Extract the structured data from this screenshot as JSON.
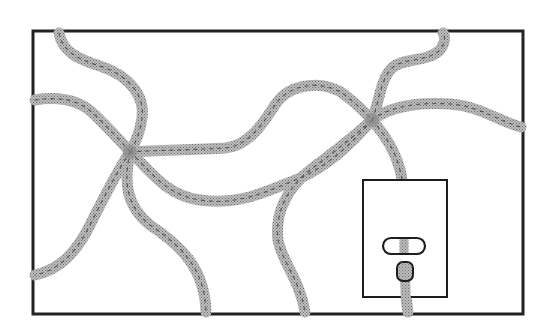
{
  "illustration": {
    "title": "Tangled cords plugged into a wall outlet",
    "colors": {
      "background": "#ffffff",
      "frame": "#222222",
      "cord_fill": "#a8a8a8",
      "cord_stitch": "#3a3a3a",
      "outlet_stroke": "#1e1e1e",
      "outlet_fill": "#ffffff"
    },
    "frame": {
      "x": 33,
      "y": 31,
      "width": 490,
      "height": 283,
      "stroke_width": 3
    },
    "knots": [
      {
        "name": "left-knot",
        "x": 130,
        "y": 152
      },
      {
        "name": "right-knot",
        "x": 372,
        "y": 120
      }
    ],
    "outlet": {
      "plate": {
        "x": 363,
        "y": 180,
        "width": 84,
        "height": 117
      },
      "slot": {
        "x": 383,
        "y": 238,
        "width": 42,
        "height": 16,
        "radius": 8
      },
      "plug": {
        "x": 397,
        "y": 262,
        "width": 16,
        "height": 18
      }
    }
  }
}
